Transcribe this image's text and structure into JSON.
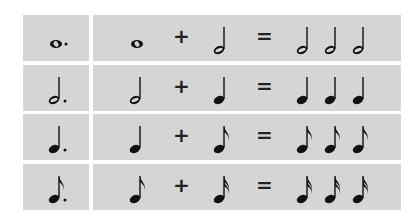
{
  "colors": {
    "cell_bg": "#d5d5d5",
    "ink": "#111111",
    "page_bg": "#ffffff"
  },
  "operators": {
    "plus": "+",
    "equals": "="
  },
  "rows": [
    {
      "dotted": "dotted-whole-note",
      "base": "whole-note",
      "added": "half-note",
      "result": [
        "half-note",
        "half-note",
        "half-note"
      ],
      "plus": "+",
      "equals": "="
    },
    {
      "dotted": "dotted-half-note",
      "base": "half-note",
      "added": "quarter-note",
      "result": [
        "quarter-note",
        "quarter-note",
        "quarter-note"
      ],
      "plus": "+",
      "equals": "="
    },
    {
      "dotted": "dotted-quarter-note",
      "base": "quarter-note",
      "added": "eighth-note",
      "result": [
        "eighth-note",
        "eighth-note",
        "eighth-note"
      ],
      "plus": "+",
      "equals": "="
    },
    {
      "dotted": "dotted-eighth-note",
      "base": "eighth-note",
      "added": "sixteenth-note",
      "result": [
        "sixteenth-note",
        "sixteenth-note",
        "sixteenth-note"
      ],
      "plus": "+",
      "equals": "="
    }
  ]
}
